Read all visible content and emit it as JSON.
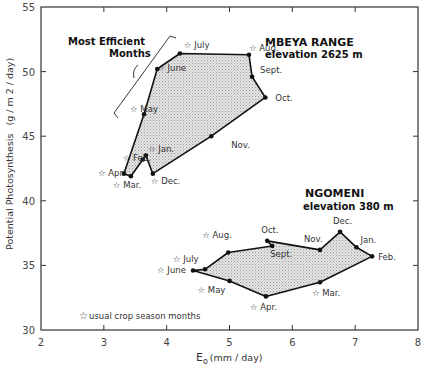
{
  "chart_data": {
    "type": "line",
    "title": "",
    "xlabel": "E_o (mm / day)",
    "ylabel": "Potential Photosynthesis (g / m2 / day)",
    "xlim": [
      2,
      8
    ],
    "ylim": [
      30,
      55
    ],
    "x_ticks": [
      2,
      3,
      4,
      5,
      6,
      7,
      8
    ],
    "y_ticks": [
      30,
      35,
      40,
      45,
      50,
      55
    ],
    "grid": false,
    "series": [
      {
        "name": "MBEYA RANGE",
        "subtitle": "elevation 2625 m",
        "closed": true,
        "points": [
          {
            "month": "July",
            "x": 4.21,
            "y": 51.4,
            "crop_season": true
          },
          {
            "month": "Aug.",
            "x": 5.31,
            "y": 51.3,
            "crop_season": true
          },
          {
            "month": "Sept.",
            "x": 5.36,
            "y": 49.6,
            "crop_season": false
          },
          {
            "month": "Oct.",
            "x": 5.57,
            "y": 48.0,
            "crop_season": false
          },
          {
            "month": "Nov.",
            "x": 4.71,
            "y": 45.0,
            "crop_season": false
          },
          {
            "month": "Dec.",
            "x": 3.78,
            "y": 42.1,
            "crop_season": true
          },
          {
            "month": "Jan.",
            "x": 3.67,
            "y": 43.5,
            "crop_season": true
          },
          {
            "month": "Feb.",
            "x": 3.62,
            "y": 43.2,
            "crop_season": true
          },
          {
            "month": "Mar.",
            "x": 3.43,
            "y": 41.9,
            "crop_season": true
          },
          {
            "month": "Apr.",
            "x": 3.32,
            "y": 42.1,
            "crop_season": true
          },
          {
            "month": "May",
            "x": 3.64,
            "y": 46.7,
            "crop_season": true
          },
          {
            "month": "June",
            "x": 3.85,
            "y": 50.2,
            "crop_season": true
          }
        ]
      },
      {
        "name": "NGOMENI",
        "subtitle": "elevation 380 m",
        "closed": true,
        "points": [
          {
            "month": "June",
            "x": 4.42,
            "y": 34.6,
            "crop_season": true
          },
          {
            "month": "July",
            "x": 4.61,
            "y": 34.7,
            "crop_season": true
          },
          {
            "month": "Aug.",
            "x": 4.98,
            "y": 36.0,
            "crop_season": true
          },
          {
            "month": "Sept.",
            "x": 5.68,
            "y": 36.5,
            "crop_season": false
          },
          {
            "month": "Oct.",
            "x": 5.6,
            "y": 36.9,
            "crop_season": false
          },
          {
            "month": "Nov.",
            "x": 6.44,
            "y": 36.2,
            "crop_season": false
          },
          {
            "month": "Dec.",
            "x": 6.76,
            "y": 37.6,
            "crop_season": false
          },
          {
            "month": "Jan.",
            "x": 7.02,
            "y": 36.4,
            "crop_season": false
          },
          {
            "month": "Feb.",
            "x": 7.27,
            "y": 35.7,
            "crop_season": false
          },
          {
            "month": "Mar.",
            "x": 6.44,
            "y": 33.7,
            "crop_season": true
          },
          {
            "month": "Apr.",
            "x": 5.58,
            "y": 32.6,
            "crop_season": true
          },
          {
            "month": "May",
            "x": 5.0,
            "y": 33.8,
            "crop_season": true
          }
        ]
      }
    ],
    "annotations": [
      "Most Efficient Months",
      "☆ usual crop season months"
    ],
    "legend": {
      "text": "usual crop season months",
      "symbol": "star",
      "position": "bottom-left"
    }
  },
  "labels": {
    "mbeya_title": "MBEYA RANGE",
    "mbeya_elev": "elevation 2625 m",
    "ngomeni_title": "NGOMENI",
    "ngomeni_elev": "elevation 380 m",
    "efficient_1": "Most Efficient",
    "efficient_2": "Months",
    "legend": "usual crop season months",
    "ylabel_a": "Potential Photosynthesis",
    "ylabel_b": "(g / m 2 / day)",
    "xlabel_main": "E",
    "xlabel_sub": "o",
    "xlabel_unit": "(mm / day)"
  }
}
